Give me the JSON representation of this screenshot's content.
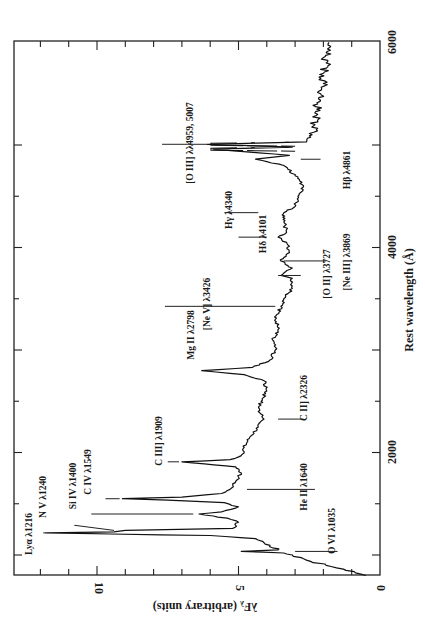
{
  "chart_data": {
    "type": "line",
    "title": "",
    "xlabel": "Rest wavelength (Å)",
    "ylabel": "λF_λ (arbitrary units)",
    "xlim": [
      800,
      6000
    ],
    "ylim": [
      0,
      13
    ],
    "orientation": "rotated-90 (wavelength runs bottom-to-top, flux runs right-to-left)",
    "grid": false,
    "legend": null,
    "x_ticks": [
      2000,
      4000,
      6000
    ],
    "y_ticks": [
      0,
      5,
      10
    ],
    "series": [
      {
        "name": "composite quasar spectrum",
        "x": [
          800,
          850,
          900,
          950,
          1000,
          1020,
          1035,
          1050,
          1080,
          1120,
          1160,
          1190,
          1205,
          1216,
          1225,
          1240,
          1260,
          1290,
          1320,
          1360,
          1390,
          1400,
          1420,
          1470,
          1510,
          1535,
          1549,
          1565,
          1600,
          1640,
          1680,
          1720,
          1760,
          1800,
          1860,
          1890,
          1909,
          1930,
          1970,
          2050,
          2150,
          2250,
          2326,
          2400,
          2500,
          2600,
          2700,
          2760,
          2798,
          2830,
          2900,
          3000,
          3100,
          3200,
          3300,
          3426,
          3500,
          3600,
          3700,
          3727,
          3800,
          3869,
          3950,
          4050,
          4101,
          4150,
          4250,
          4340,
          4400,
          4500,
          4600,
          4700,
          4800,
          4861,
          4900,
          4959,
          4980,
          5007,
          5030,
          5100,
          5200,
          5300,
          5400,
          5500,
          5600,
          5700,
          5800,
          5900,
          6000
        ],
        "y": [
          0.5,
          1.2,
          1.9,
          2.6,
          3.1,
          3.4,
          4.9,
          3.6,
          3.9,
          4.1,
          4.4,
          6.0,
          9.5,
          11.8,
          9.4,
          9.0,
          5.2,
          5.1,
          5.0,
          5.4,
          6.2,
          6.4,
          5.6,
          5.0,
          5.5,
          7.5,
          9.1,
          7.0,
          5.6,
          5.3,
          5.2,
          5.1,
          5.0,
          4.9,
          5.1,
          6.2,
          7.0,
          5.3,
          4.9,
          4.8,
          4.6,
          4.3,
          4.1,
          4.3,
          4.2,
          4.0,
          4.1,
          4.8,
          6.3,
          4.5,
          3.9,
          3.7,
          3.8,
          3.6,
          3.7,
          3.5,
          3.4,
          3.1,
          3.1,
          3.5,
          3.1,
          3.5,
          3.2,
          3.3,
          3.6,
          3.3,
          3.4,
          3.4,
          3.0,
          2.9,
          2.7,
          3.0,
          3.4,
          4.4,
          3.2,
          5.9,
          3.1,
          6.1,
          2.6,
          2.4,
          2.3,
          2.2,
          2.2,
          2.1,
          2.0,
          2.0,
          1.9,
          1.9,
          1.8
        ]
      }
    ],
    "annotations": [
      {
        "label": "Lyα λ1216",
        "wavelength": 1216
      },
      {
        "label": "N V λ1240",
        "wavelength": 1240
      },
      {
        "label": "Si IV λ1400",
        "wavelength": 1400
      },
      {
        "label": "C IV λ1549",
        "wavelength": 1549
      },
      {
        "label": "C III] λ1909",
        "wavelength": 1909
      },
      {
        "label": "He II λ1640",
        "wavelength": 1640
      },
      {
        "label": "O VI λ1035",
        "wavelength": 1035
      },
      {
        "label": "C II] λ2326",
        "wavelength": 2326
      },
      {
        "label": "Mg II λ2798",
        "wavelength": 2798
      },
      {
        "label": "[Ne V] λ3426",
        "wavelength": 3426
      },
      {
        "label": "[O II] λ3727",
        "wavelength": 3727
      },
      {
        "label": "[Ne III] λ3869",
        "wavelength": 3869
      },
      {
        "label": "Hδ λ4101",
        "wavelength": 4101
      },
      {
        "label": "Hγ λ4340",
        "wavelength": 4340
      },
      {
        "label": "Hβ λ4861",
        "wavelength": 4861
      },
      {
        "label": "[O III] λλ4959, 5007",
        "wavelength": 5007,
        "note": "peaks truncated with broken lines"
      }
    ]
  },
  "labels": {
    "xlabel": "Rest wavelength (Å)",
    "ylabel": "λF",
    "ylabel_sub": "λ",
    "ylabel_rest": " (arbitrary units)",
    "xt2000": "2000",
    "xt4000": "4000",
    "xt6000": "6000",
    "yt0": "0",
    "yt5": "5",
    "yt10": "10",
    "lya": "Lyα λ1216",
    "nv": "N V λ1240",
    "siiv": "Si IV λ1400",
    "civ": "C IV λ1549",
    "ciii": "C III] λ1909",
    "heii": "He II λ1640",
    "ovi": "O VI λ1035",
    "cii": "C II] λ2326",
    "mgii": "Mg II λ2798",
    "nev": "[Ne V] λ3426",
    "oii": "[O II] λ3727",
    "neiii": "[Ne III] λ3869",
    "hd": "Hδ λ4101",
    "hg": "Hγ λ4340",
    "hb": "Hβ λ4861",
    "oiii": "[O III] λλ4959, 5007"
  }
}
